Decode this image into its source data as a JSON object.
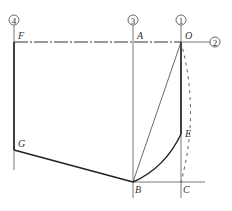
{
  "diagram": {
    "axis_markers": [
      {
        "id": "4",
        "label": "4",
        "x": 14,
        "y": 20
      },
      {
        "id": "3",
        "label": "3",
        "x": 133,
        "y": 20
      },
      {
        "id": "1",
        "label": "1",
        "x": 181,
        "y": 20
      },
      {
        "id": "2",
        "label": "2",
        "x": 214,
        "y": 42
      }
    ],
    "points": {
      "F": {
        "label": "F",
        "x": 14,
        "y": 42
      },
      "A": {
        "label": "A",
        "x": 133,
        "y": 42
      },
      "O": {
        "label": "O",
        "x": 181,
        "y": 42
      },
      "G": {
        "label": "G",
        "x": 14,
        "y": 150
      },
      "E": {
        "label": "E",
        "x": 181,
        "y": 134
      },
      "B": {
        "label": "B",
        "x": 133,
        "y": 182
      },
      "C": {
        "label": "C",
        "x": 181,
        "y": 182
      }
    }
  }
}
